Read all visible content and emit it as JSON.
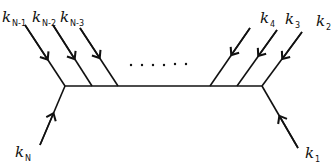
{
  "diagram": {
    "type": "feynman-like momentum diagram",
    "ellipsis": "......",
    "labels": {
      "kN_1": {
        "base": "k",
        "sub": "N-1"
      },
      "kN_2": {
        "base": "k",
        "sub": "N-2"
      },
      "kN_3": {
        "base": "k",
        "sub": "N-3"
      },
      "k4": {
        "base": "k",
        "sub": "4"
      },
      "k3": {
        "base": "k",
        "sub": "3"
      },
      "k2": {
        "base": "k",
        "sub": "2"
      },
      "kN": {
        "base": "k",
        "sub": "N"
      },
      "k1": {
        "base": "k",
        "sub": "1"
      }
    },
    "line_color": "#111111"
  }
}
